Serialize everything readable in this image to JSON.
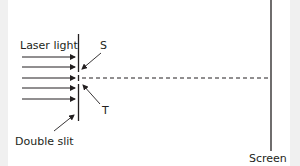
{
  "diagram": {
    "labels": {
      "laser": "Laser light",
      "slit_s": "S",
      "slit_t": "T",
      "double_slit": "Double slit",
      "screen": "Screen"
    },
    "colors": {
      "line": "#231f20",
      "background": "#ffffff",
      "margin": "#f0f0f0"
    },
    "arrows_count": 5
  }
}
